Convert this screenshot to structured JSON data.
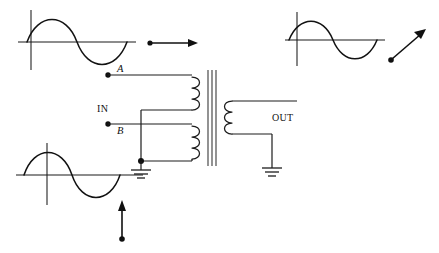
{
  "diagram": {
    "colors": {
      "ink": "#1a1a1a",
      "wave": "#121212",
      "core": "#3a3a3a",
      "background": "#ffffff"
    }
  },
  "labels": {
    "terminal_a": "A",
    "terminal_b": "B",
    "input": "IN",
    "output": "OUT"
  },
  "waveforms": [
    {
      "id": "input-waveform-top-left",
      "shape": "sine",
      "cycles": 1,
      "phase": "positive-first",
      "position": "top-left"
    },
    {
      "id": "output-waveform-top-right",
      "shape": "sine",
      "cycles": 1,
      "phase": "positive-first",
      "position": "top-right"
    },
    {
      "id": "input-waveform-bottom-left",
      "shape": "sine",
      "cycles": 1,
      "phase": "positive-first",
      "position": "bottom-left"
    }
  ],
  "arrows": [
    {
      "id": "arrow-horizontal",
      "direction": "right",
      "from": "dot",
      "to": "arrowhead"
    },
    {
      "id": "arrow-diagonal",
      "direction": "up-right",
      "from": "dot",
      "to": "arrowhead"
    },
    {
      "id": "arrow-vertical",
      "direction": "up",
      "from": "dot",
      "to": "arrowhead"
    }
  ],
  "circuit": {
    "component": "transformer",
    "primary_coils": 2,
    "secondary_coils": 1,
    "core_lines": 3,
    "grounds": 2,
    "junction_dots": 1,
    "terminals": [
      "A",
      "B"
    ]
  }
}
